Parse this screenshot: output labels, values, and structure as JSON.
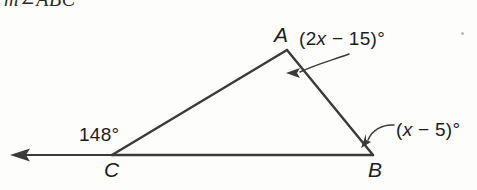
{
  "figure": {
    "type": "geometry-diagram",
    "header_text": "m∠ABC",
    "background_color": "#fdfdfc",
    "stroke_color": "#3a3a3a",
    "text_color": "#1c1c1c",
    "vertices": [
      {
        "name": "A",
        "label": "A",
        "x": 287,
        "y": 50
      },
      {
        "name": "B",
        "label": "B",
        "x": 373,
        "y": 155
      },
      {
        "name": "C",
        "label": "C",
        "x": 112,
        "y": 155
      }
    ],
    "ray": {
      "name": "ray-from-C-left",
      "from_x": 112,
      "from_y": 155,
      "to_x": 12,
      "to_y": 155,
      "arrowhead": "left"
    },
    "angle_labels": [
      {
        "name": "angle-at-A",
        "at_vertex": "A",
        "text": "(2x − 15)°",
        "parts": [
          {
            "text": "(2",
            "italic": false
          },
          {
            "text": "x",
            "italic": true
          },
          {
            "text": " − 15)°",
            "italic": false
          }
        ],
        "leader": true
      },
      {
        "name": "angle-at-B",
        "at_vertex": "B",
        "text": "(x − 5)°",
        "parts": [
          {
            "text": "(",
            "italic": false
          },
          {
            "text": "x",
            "italic": true
          },
          {
            "text": " − 5)°",
            "italic": false
          }
        ],
        "leader": true
      },
      {
        "name": "exterior-angle-at-C",
        "at_vertex": "C",
        "text": "148°",
        "parts": [
          {
            "text": "148°",
            "italic": false
          }
        ],
        "leader": false
      }
    ]
  }
}
